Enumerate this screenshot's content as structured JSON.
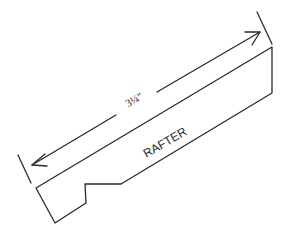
{
  "diagram": {
    "dimension_label": "3¼″",
    "part_label": "RAFTER",
    "stroke_color": "#2a2a2a",
    "background": "#ffffff"
  }
}
